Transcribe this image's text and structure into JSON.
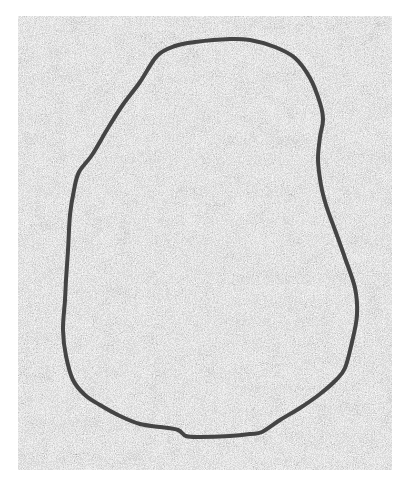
{
  "image": {
    "description": "Grayscale noise texture with a single closed dark contour outlining a rounded, pear-shaped region",
    "background_color": "#ffffff",
    "texture_region": {
      "x": 18,
      "y": 16,
      "width": 374,
      "height": 454
    },
    "texture_colors": {
      "light": "#eeeeee",
      "dark": "#555555"
    },
    "contour": {
      "stroke_color": "#444444",
      "stroke_width": 4,
      "points": [
        [
          157,
          56
        ],
        [
          175,
          46
        ],
        [
          195,
          42
        ],
        [
          230,
          39
        ],
        [
          250,
          40
        ],
        [
          275,
          47
        ],
        [
          295,
          58
        ],
        [
          310,
          78
        ],
        [
          320,
          103
        ],
        [
          323,
          120
        ],
        [
          320,
          137
        ],
        [
          318,
          160
        ],
        [
          321,
          185
        ],
        [
          326,
          205
        ],
        [
          335,
          230
        ],
        [
          345,
          258
        ],
        [
          355,
          288
        ],
        [
          357,
          315
        ],
        [
          352,
          342
        ],
        [
          345,
          368
        ],
        [
          336,
          380
        ],
        [
          320,
          394
        ],
        [
          300,
          408
        ],
        [
          280,
          420
        ],
        [
          262,
          432
        ],
        [
          250,
          434
        ],
        [
          230,
          436
        ],
        [
          200,
          437
        ],
        [
          186,
          436
        ],
        [
          178,
          430
        ],
        [
          160,
          427
        ],
        [
          140,
          424
        ],
        [
          120,
          416
        ],
        [
          100,
          405
        ],
        [
          85,
          395
        ],
        [
          73,
          380
        ],
        [
          66,
          356
        ],
        [
          63,
          330
        ],
        [
          65,
          300
        ],
        [
          66,
          280
        ],
        [
          68,
          250
        ],
        [
          70,
          215
        ],
        [
          74,
          190
        ],
        [
          79,
          172
        ],
        [
          92,
          155
        ],
        [
          108,
          128
        ],
        [
          122,
          106
        ],
        [
          140,
          82
        ],
        [
          157,
          56
        ]
      ]
    }
  }
}
